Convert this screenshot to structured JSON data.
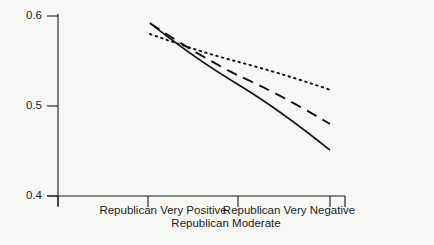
{
  "chart_data": {
    "type": "line",
    "title": "",
    "xlabel": "",
    "ylabel": "",
    "grid": false,
    "legend": "none",
    "x": [
      0,
      1,
      2
    ],
    "categories": [
      "Republican Very Positive",
      "Republican Moderate",
      "Republican Very Negative"
    ],
    "xtick_labels": [
      "Republican Very Positive",
      "Republican Moderate",
      "Republican Very Negative"
    ],
    "ytick_labels": [
      "0.6",
      "0.5",
      "0.4"
    ],
    "ytick_values": [
      0.6,
      0.5,
      0.4
    ],
    "ylim": [
      0.4,
      0.6
    ],
    "xlim": [
      -0.55,
      2.35
    ],
    "series": [
      {
        "name": "solid",
        "style": "solid",
        "color": "#111111",
        "values": [
          0.592,
          0.524,
          0.451
        ]
      },
      {
        "name": "dashed",
        "style": "dashed",
        "color": "#111111",
        "values": [
          0.592,
          0.534,
          0.48
        ]
      },
      {
        "name": "dotted",
        "style": "dotted",
        "color": "#111111",
        "values": [
          0.58,
          0.549,
          0.518
        ]
      }
    ]
  },
  "axis": {
    "y_top_label": "0.6",
    "y_mid_label": "0.5",
    "y_bottom_label": "0.4",
    "x_left_label": "Republican Very Positive",
    "x_center_label": "Republican Moderate",
    "x_right_label": "Republican Very Negative"
  },
  "colors": {
    "background": "#f7f7f5",
    "axis": "#1b1b1b",
    "line": "#111111"
  }
}
